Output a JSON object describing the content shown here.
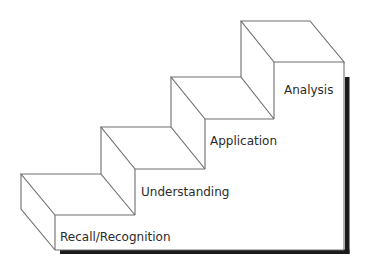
{
  "diagram": {
    "type": "staircase",
    "steps": [
      {
        "level": 1,
        "label": "Recall/Recognition"
      },
      {
        "level": 2,
        "label": "Understanding"
      },
      {
        "level": 3,
        "label": "Application"
      },
      {
        "level": 4,
        "label": "Analysis"
      }
    ],
    "colors": {
      "line": "#6e6e6e",
      "shadow": "#1a1a1a",
      "text": "#2b2b2b",
      "background": "#ffffff"
    }
  }
}
